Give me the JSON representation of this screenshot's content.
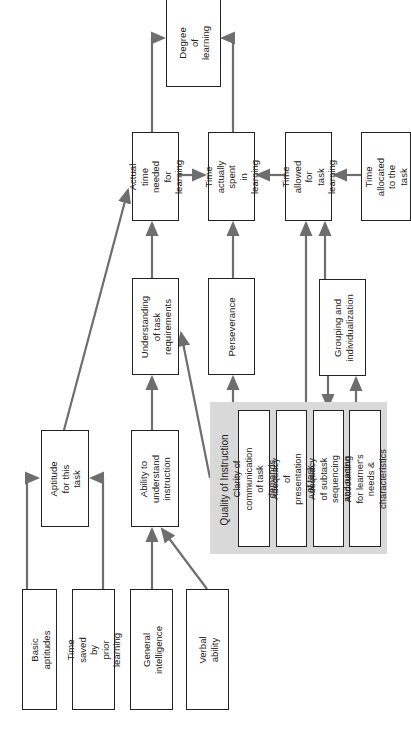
{
  "diagram": {
    "nodes": {
      "degree_of_learning": "Degree\nof\nlearning",
      "actual_time_needed": "Actual time\nneeded for\nlearning",
      "time_actually_spent": "Time actually\nspent\nin learning",
      "time_allowed": "Time allowed\nfor\ntask learning",
      "time_allocated": "Time allocated\nto the task",
      "understanding_task": "Understanding\nof task\nrequirements",
      "perseverance": "Perseverance",
      "grouping": "Grouping and\nindividualization",
      "aptitude": "Aptitude\nfor this task",
      "ability_understand": "Ability to\nunderstand\ninstruction",
      "basic_aptitudes": "Basic aptitudes",
      "time_saved": "Time saved by\nprior learning",
      "general_intelligence": "General\nintelligence",
      "verbal_ability": "Verbal ability"
    },
    "quality_panel": {
      "title": "Quality of Instruction",
      "items": [
        "Clarity of communication\nof task demands",
        "Adequacy of presentation\nof task",
        "Adequacy of subtask\nsequencing and pacing",
        "Accounting for learner's\nneeds & characteristics"
      ]
    },
    "colors": {
      "line": "#6e6e6e",
      "border": "#222222",
      "panel": "#d9d9d9"
    }
  }
}
